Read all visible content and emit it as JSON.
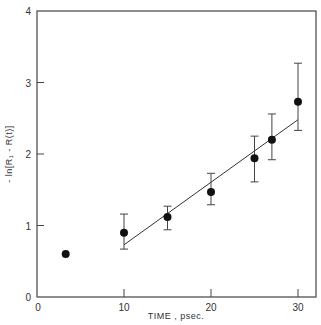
{
  "chart_data": {
    "type": "scatter",
    "title": "",
    "xlabel": "TIME , psec.",
    "ylabel": "- ln[R₁ - R(t)]",
    "xlim": [
      0,
      31
    ],
    "ylim": [
      0,
      4
    ],
    "x_ticks": [
      0,
      10,
      20,
      30
    ],
    "y_ticks": [
      0,
      1,
      2,
      3,
      4
    ],
    "grid": false,
    "legend": null,
    "series": [
      {
        "name": "data",
        "x": [
          3.3,
          10,
          15,
          20,
          25,
          27,
          30
        ],
        "y": [
          0.6,
          0.9,
          1.12,
          1.47,
          1.94,
          2.2,
          2.73
        ],
        "err_low": [
          null,
          0.67,
          0.94,
          1.29,
          1.61,
          1.92,
          2.33
        ],
        "err_high": [
          null,
          1.16,
          1.27,
          1.73,
          2.25,
          2.56,
          3.27
        ]
      },
      {
        "name": "linear fit",
        "type": "line",
        "x": [
          10,
          30
        ],
        "y": [
          0.73,
          2.48
        ]
      }
    ]
  }
}
